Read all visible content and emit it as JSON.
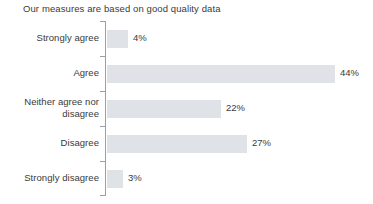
{
  "chart_data": {
    "type": "bar",
    "orientation": "horizontal",
    "title": "Our measures are based on good quality data",
    "xlabel": "",
    "ylabel": "",
    "categories": [
      "Strongly agree",
      "Agree",
      "Neither agree nor disagree",
      "Disagree",
      "Strongly disagree"
    ],
    "values": [
      4,
      44,
      22,
      27,
      3
    ],
    "value_labels": [
      "4%",
      "44%",
      "22%",
      "27%",
      "3%"
    ],
    "xlim": [
      0,
      50
    ],
    "unit": "%",
    "grid": false,
    "legend": false,
    "bar_color": "#dfe3e7",
    "axis_color": "#9aa0a6",
    "text_color": "#3a3a3a",
    "background_color": "#ffffff"
  },
  "rows": [
    {
      "label": "Strongly agree",
      "label_line_1": "Strongly agree",
      "label_line_2": "",
      "value": 4,
      "value_label": "4%"
    },
    {
      "label": "Agree",
      "label_line_1": "Agree",
      "label_line_2": "",
      "value": 44,
      "value_label": "44%"
    },
    {
      "label": "Neither agree nor disagree",
      "label_line_1": "Neither agree nor",
      "label_line_2": "disagree",
      "value": 22,
      "value_label": "22%"
    },
    {
      "label": "Disagree",
      "label_line_1": "Disagree",
      "label_line_2": "",
      "value": 27,
      "value_label": "27%"
    },
    {
      "label": "Strongly disagree",
      "label_line_1": "Strongly disagree",
      "label_line_2": "",
      "value": 3,
      "value_label": "3%"
    }
  ]
}
